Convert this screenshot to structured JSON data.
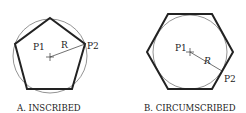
{
  "diagrams": [
    {
      "id": "inscribed",
      "caption": "A. INSCRIBED",
      "center_label": "P1",
      "point_label": "P2",
      "radius_label": "R",
      "shape": "pentagon"
    },
    {
      "id": "circumscribed",
      "caption": "B. CIRCUMSCRIBED",
      "center_label": "P1",
      "point_label": "P2",
      "radius_label": "R",
      "shape": "hexagon"
    }
  ],
  "colors": {
    "stroke": "#222222",
    "circle": "#777777"
  }
}
